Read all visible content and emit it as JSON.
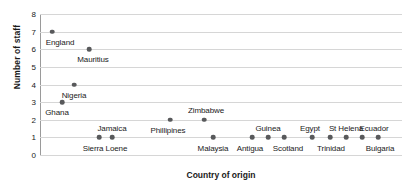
{
  "chart_data": {
    "type": "scatter",
    "title": "",
    "xlabel": "Country of origin",
    "ylabel": "Number of staff",
    "ylim": [
      0,
      8
    ],
    "yticks": [
      0,
      1,
      2,
      3,
      4,
      5,
      6,
      7,
      8
    ],
    "grid": true,
    "legend": "none",
    "categories": [
      "England",
      "Mauritius",
      "Nigeria",
      "Ghana",
      "Sierra Leone",
      "Jamaica",
      "Phillipines",
      "Zimbabwe",
      "Malaysia",
      "Antigua",
      "Guinea",
      "Scotland",
      "Egypt",
      "Trinidad",
      "St Helena",
      "Ecuador",
      "Bulgaria"
    ],
    "values": [
      7,
      6,
      4,
      3,
      1,
      1,
      2,
      2,
      1,
      1,
      1,
      1,
      1,
      1,
      1,
      1,
      1
    ],
    "points": [
      {
        "label": "England",
        "value": 7,
        "x_px": 52,
        "label_dx": 8,
        "label_dy": 11,
        "label_anchor": "below"
      },
      {
        "label": "Mauritius",
        "value": 6,
        "x_px": 89,
        "label_dx": 4,
        "label_dy": 11,
        "label_anchor": "below"
      },
      {
        "label": "Nigeria",
        "value": 4,
        "x_px": 74,
        "label_dx": 0,
        "label_dy": 11,
        "label_anchor": "below"
      },
      {
        "label": "Ghana",
        "value": 3,
        "x_px": 62,
        "label_dx": -5,
        "label_dy": 11,
        "label_anchor": "below"
      },
      {
        "label": "Sierra Loene",
        "value": 1,
        "x_px": 99,
        "label_dx": 6,
        "label_dy": 12,
        "label_anchor": "below"
      },
      {
        "label": "Jamaica",
        "value": 1,
        "x_px": 112,
        "label_dx": 0,
        "label_dy": -8,
        "label_anchor": "above"
      },
      {
        "label": "Phillipines",
        "value": 2,
        "x_px": 170,
        "label_dx": -2,
        "label_dy": 11,
        "label_anchor": "below"
      },
      {
        "label": "Zimbabwe",
        "value": 2,
        "x_px": 204,
        "label_dx": 2,
        "label_dy": -9,
        "label_anchor": "above"
      },
      {
        "label": "Malaysia",
        "value": 1,
        "x_px": 213,
        "label_dx": 0,
        "label_dy": 12,
        "label_anchor": "below"
      },
      {
        "label": "Antigua",
        "value": 1,
        "x_px": 252,
        "label_dx": -2,
        "label_dy": 12,
        "label_anchor": "below"
      },
      {
        "label": "Guinea",
        "value": 1,
        "x_px": 268,
        "label_dx": 0,
        "label_dy": -8,
        "label_anchor": "above"
      },
      {
        "label": "Scotland",
        "value": 1,
        "x_px": 284,
        "label_dx": 4,
        "label_dy": 12,
        "label_anchor": "below"
      },
      {
        "label": "Egypt",
        "value": 1,
        "x_px": 312,
        "label_dx": -2,
        "label_dy": -8,
        "label_anchor": "above"
      },
      {
        "label": "Trinidad",
        "value": 1,
        "x_px": 330,
        "label_dx": 1,
        "label_dy": 12,
        "label_anchor": "below"
      },
      {
        "label": "St Helena",
        "value": 1,
        "x_px": 346,
        "label_dx": 0,
        "label_dy": -8,
        "label_anchor": "above"
      },
      {
        "label": "Ecuador",
        "value": 1,
        "x_px": 362,
        "label_dx": 12,
        "label_dy": -8,
        "label_anchor": "above"
      },
      {
        "label": "Bulgaria",
        "value": 1,
        "x_px": 378,
        "label_dx": 2,
        "label_dy": 12,
        "label_anchor": "below"
      }
    ],
    "colors": {
      "marker": "#58595b",
      "gridline": "#d6d6d6",
      "axis": "#9a9a9a",
      "text": "#1a1a1a",
      "background": "#ffffff"
    }
  }
}
